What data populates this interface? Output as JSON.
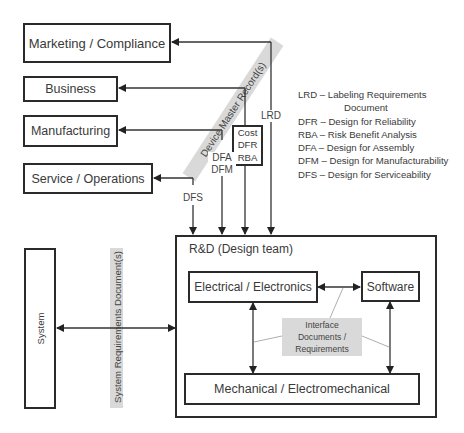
{
  "stakeholders": {
    "marketing": "Marketing / Compliance",
    "business": "Business",
    "manufacturing": "Manufacturing",
    "service": "Service / Operations"
  },
  "dmr_label": "Device Master Record(s)",
  "flows": {
    "dfs": "DFS",
    "dfa": "DFA",
    "dfm": "DFM",
    "lrd": "LRD",
    "cost_box": [
      "Cost",
      "DFR",
      "RBA"
    ]
  },
  "legend": [
    "LRD – Labeling Requirements",
    "Document",
    "DFR – Design for Reliability",
    "RBA – Risk Benefit Analysis",
    "DFA – Design for Assembly",
    "DFM – Design for Manufacturability",
    "DFS – Design for Serviceability"
  ],
  "system": {
    "label": "System",
    "srd_label": "System Requirements Document(s)"
  },
  "rd": {
    "title": "R&D (Design team)",
    "electrical": "Electrical / Electronics",
    "software": "Software",
    "mechanical": "Mechanical / Electromechanical",
    "interface": [
      "Interface",
      "Documents /",
      "Requirements"
    ]
  }
}
